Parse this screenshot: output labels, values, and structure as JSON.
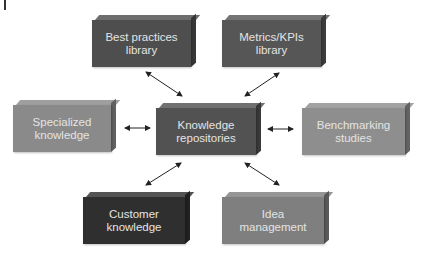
{
  "diagram": {
    "center": {
      "id": "knowledge-repositories",
      "label": "Knowledge\nrepositories",
      "color": "#525252"
    },
    "nodes": [
      {
        "id": "best-practices-library",
        "label": "Best practices\nlibrary",
        "color": "#4e4e4e",
        "x": 92,
        "y": 15,
        "w": 104,
        "h": 52
      },
      {
        "id": "metrics-kpis-library",
        "label": "Metrics/KPIs\nlibrary",
        "color": "#565656",
        "x": 222,
        "y": 15,
        "w": 104,
        "h": 52
      },
      {
        "id": "specialized-knowledge",
        "label": "Specialized\nknowledge",
        "color": "#8a8a8a",
        "x": 13,
        "y": 100,
        "w": 103,
        "h": 52
      },
      {
        "id": "knowledge-repositories",
        "label": "Knowledge\nrepositories",
        "color": "#525252",
        "x": 156,
        "y": 103,
        "w": 105,
        "h": 52
      },
      {
        "id": "benchmarking-studies",
        "label": "Benchmarking\nstudies",
        "color": "#8e8e8e",
        "x": 302,
        "y": 103,
        "w": 108,
        "h": 52
      },
      {
        "id": "customer-knowledge",
        "label": "Customer\nknowledge",
        "color": "#2f2f2f",
        "x": 83,
        "y": 192,
        "w": 107,
        "h": 52
      },
      {
        "id": "idea-management",
        "label": "Idea\nmanagement",
        "color": "#7f7f7f",
        "x": 222,
        "y": 192,
        "w": 107,
        "h": 52
      }
    ],
    "edges": [
      {
        "from": "knowledge-repositories",
        "to": "best-practices-library",
        "type": "bidirectional"
      },
      {
        "from": "knowledge-repositories",
        "to": "metrics-kpis-library",
        "type": "bidirectional"
      },
      {
        "from": "knowledge-repositories",
        "to": "specialized-knowledge",
        "type": "bidirectional"
      },
      {
        "from": "knowledge-repositories",
        "to": "benchmarking-studies",
        "type": "bidirectional"
      },
      {
        "from": "knowledge-repositories",
        "to": "customer-knowledge",
        "type": "bidirectional"
      },
      {
        "from": "knowledge-repositories",
        "to": "idea-management",
        "type": "bidirectional"
      }
    ]
  }
}
